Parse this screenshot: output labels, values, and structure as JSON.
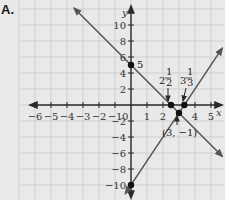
{
  "panel_label": "A.",
  "chart_data": {
    "type": "line",
    "title": "",
    "xlabel": "x",
    "ylabel": "y",
    "xlim": [
      -7,
      6
    ],
    "ylim": [
      -12,
      12
    ],
    "grid": true,
    "x_ticks": [
      -6,
      -5,
      -4,
      -3,
      -2,
      -1,
      1,
      2,
      4,
      5
    ],
    "x_tick_labels": [
      "−6",
      "−5",
      "−4",
      "−3",
      "−2",
      "−1",
      "1",
      "2",
      "4",
      "5"
    ],
    "origin_label": "0",
    "y_ticks": [
      10,
      8,
      6,
      4,
      2,
      -2,
      -4,
      -6,
      -8,
      -10
    ],
    "y_tick_labels": [
      "10",
      "8",
      "6",
      "4",
      "2",
      "−2",
      "−4",
      "−6",
      "−8",
      "−10"
    ],
    "series": [
      {
        "name": "y = -2x + 5",
        "slope": -2,
        "intercept": 5,
        "x_range": [
          -3.55,
          5.7
        ],
        "arrows": "both"
      },
      {
        "name": "y = 3x - 10",
        "slope": 3,
        "intercept": -10,
        "x_range": [
          -0.35,
          5.7
        ],
        "arrows": "both"
      }
    ],
    "points": [
      {
        "x": 0,
        "y": 5,
        "label": "5"
      },
      {
        "x": 2.5,
        "y": 0,
        "label": "2 1/2"
      },
      {
        "x": 3.3333,
        "y": 0,
        "label": "3 1/3"
      },
      {
        "x": 3,
        "y": -1,
        "label": "(3, −1)"
      },
      {
        "x": 0,
        "y": -10,
        "label": ""
      }
    ],
    "annotations": {
      "p_2half_whole": "2",
      "p_2half_num": "1",
      "p_2half_den": "2",
      "p_3third_whole": "3",
      "p_3third_num": "1",
      "p_3third_den": "3",
      "intersection": "(3, −1)",
      "y_intercept": "5"
    }
  }
}
